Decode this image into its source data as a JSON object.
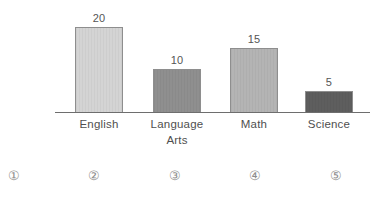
{
  "chart_data": {
    "type": "bar",
    "title": "",
    "subtitle": "",
    "xlabel": "",
    "ylabel": "",
    "ylim": [
      0,
      20
    ],
    "grid": false,
    "legend": "none",
    "axis_baseline": true,
    "categories": [
      "English",
      "Language Arts",
      "Math",
      "Science"
    ],
    "category_lines": [
      [
        "English"
      ],
      [
        "Language",
        "Arts"
      ],
      [
        "Math"
      ],
      [
        "Science"
      ]
    ],
    "values": [
      20,
      10,
      15,
      5
    ],
    "value_labels": [
      "20",
      "10",
      "15",
      "5"
    ],
    "bar_colors": [
      "#d4d4d4",
      "#8f8f8f",
      "#b4b4b4",
      "#5e5e5e"
    ],
    "bar_border_color": "#8e8e8e"
  },
  "bars": [
    {
      "label": "English",
      "line1": "English",
      "line2": "",
      "value": 20,
      "value_label": "20",
      "color": "#d4d4d4"
    },
    {
      "label": "Language Arts",
      "line1": "Language",
      "line2": "Arts",
      "value": 10,
      "value_label": "10",
      "color": "#8f8f8f"
    },
    {
      "label": "Math",
      "line1": "Math",
      "line2": "",
      "value": 15,
      "value_label": "15",
      "color": "#b4b4b4"
    },
    {
      "label": "Science",
      "line1": "Science",
      "line2": "",
      "value": 5,
      "value_label": "5",
      "color": "#5e5e5e"
    }
  ],
  "choices": [
    {
      "marker": "①"
    },
    {
      "marker": "②"
    },
    {
      "marker": "③"
    },
    {
      "marker": "④"
    },
    {
      "marker": "⑤"
    }
  ],
  "colors": {
    "background": "#ffffff",
    "axis": "#6e6e6e",
    "text": "#4f4f4f",
    "value_text": "#555555",
    "choice_text": "#8d8d8d"
  }
}
